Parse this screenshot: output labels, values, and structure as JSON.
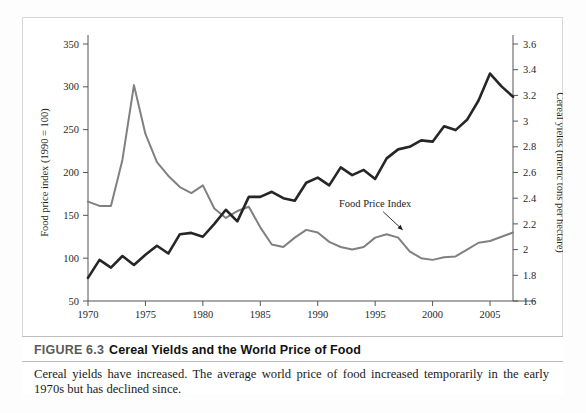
{
  "figure": {
    "label": "FIGURE 6.3",
    "title": "Cereal Yields and the World Price of Food",
    "caption": "Cereal yields have increased. The average world price of food increased temporarily in the early 1970s but has declined since."
  },
  "colors": {
    "cereal_yield_line": "#262626",
    "food_price_line": "#808080",
    "axis": "#555555",
    "frame": "#d8d8d8",
    "caption_rule": "#bdbdbd",
    "page_background": "#ffffff"
  },
  "chart_data": {
    "type": "line",
    "title": "Cereal Yields and the World Price of Food",
    "xlabel": "",
    "ylabel": "Food price index (1990 = 100)",
    "y2label": "Cereal yields (metric tons per hectare)",
    "grid": false,
    "legend": "annotated-inline",
    "xlim": [
      1970,
      2007
    ],
    "xticks": [
      1970,
      1975,
      1980,
      1985,
      1990,
      1995,
      2000,
      2005
    ],
    "xticklabels": [
      "1970",
      "1975",
      "1980",
      "1985",
      "1990",
      "1995",
      "2000",
      "2005"
    ],
    "ylim": [
      50,
      350
    ],
    "yticks": [
      50,
      100,
      150,
      200,
      250,
      300,
      350
    ],
    "yticklabels": [
      "50",
      "100",
      "150",
      "200",
      "250",
      "300",
      "350"
    ],
    "y2lim": [
      1.6,
      3.6
    ],
    "y2ticks": [
      1.6,
      1.8,
      2.0,
      2.2,
      2.4,
      2.6,
      2.8,
      3.0,
      3.2,
      3.4,
      3.6
    ],
    "y2ticklabels": [
      "1.6",
      "1.8",
      "2",
      "2.2",
      "2.4",
      "2.6",
      "2.8",
      "3",
      "3.2",
      "3.4",
      "3.6"
    ],
    "x": [
      1970,
      1971,
      1972,
      1973,
      1974,
      1975,
      1976,
      1977,
      1978,
      1979,
      1980,
      1981,
      1982,
      1983,
      1984,
      1985,
      1986,
      1987,
      1988,
      1989,
      1990,
      1991,
      1992,
      1993,
      1994,
      1995,
      1996,
      1997,
      1998,
      1999,
      2000,
      2001,
      2002,
      2003,
      2004,
      2005,
      2006,
      2007
    ],
    "series": [
      {
        "name": "Food Price Index",
        "axis": "left",
        "color": "#808080",
        "units": "index (1990 = 100)",
        "values": [
          166,
          161,
          161,
          215,
          302,
          245,
          212,
          196,
          183,
          176,
          185,
          158,
          147,
          155,
          160,
          136,
          116,
          113,
          124,
          133,
          130,
          119,
          113,
          110,
          113,
          124,
          128,
          124,
          108,
          100,
          98,
          101,
          102,
          110,
          118,
          120,
          125,
          130
        ]
      },
      {
        "name": "Cereal Yield",
        "axis": "right",
        "color": "#262626",
        "units": "metric tons per hectare",
        "values": [
          1.78,
          1.92,
          1.86,
          1.95,
          1.88,
          1.96,
          2.03,
          1.97,
          2.12,
          2.13,
          2.1,
          2.2,
          2.31,
          2.22,
          2.41,
          2.41,
          2.45,
          2.4,
          2.38,
          2.52,
          2.56,
          2.5,
          2.64,
          2.58,
          2.62,
          2.55,
          2.71,
          2.78,
          2.8,
          2.85,
          2.84,
          2.96,
          2.93,
          3.01,
          3.16,
          3.37,
          3.27,
          3.19
        ]
      }
    ],
    "annotations": [
      {
        "text": "Cereal Yield",
        "series": "Cereal Yield",
        "text_x": 1988.2,
        "text_y_index": 257,
        "arrow_to_x": 1990.6,
        "arrow_to_y_index": 232
      },
      {
        "text": "Food Price Index",
        "series": "Food Price Index",
        "text_x": 1995.0,
        "text_y_index": 160,
        "arrow_to_x": 1997.4,
        "arrow_to_y_index": 133
      }
    ]
  }
}
